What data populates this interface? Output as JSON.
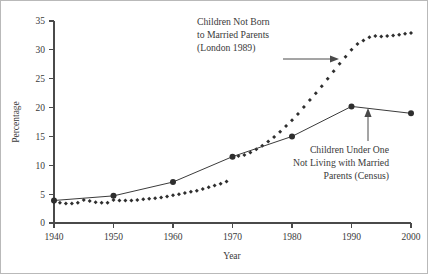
{
  "chart_data": {
    "type": "line",
    "title": "",
    "xlabel": "Year",
    "ylabel": "Percentage",
    "xlim": [
      1940,
      2000
    ],
    "ylim": [
      0,
      35
    ],
    "xticks": [
      1940,
      1950,
      1960,
      1970,
      1980,
      1990,
      2000
    ],
    "yticks": [
      0,
      5,
      10,
      15,
      20,
      25,
      30,
      35
    ],
    "grid": false,
    "legend": "annotations",
    "series": [
      {
        "name": "Children Not Born to Married Parents (London 1989)",
        "marker": "diamond",
        "style": "dotted-markers-only",
        "x": [
          1940,
          1941,
          1942,
          1943,
          1944,
          1945,
          1946,
          1947,
          1948,
          1949,
          1950,
          1951,
          1952,
          1953,
          1954,
          1955,
          1956,
          1957,
          1958,
          1959,
          1960,
          1961,
          1962,
          1963,
          1964,
          1965,
          1966,
          1967,
          1968,
          1969,
          1970,
          1971,
          1972,
          1973,
          1974,
          1975,
          1976,
          1977,
          1978,
          1979,
          1980,
          1981,
          1982,
          1983,
          1984,
          1985,
          1986,
          1987,
          1988,
          1989,
          1990,
          1991,
          1992,
          1993,
          1994,
          1995,
          1996,
          1997,
          1998,
          1999,
          2000
        ],
        "values": [
          3.6,
          3.5,
          3.4,
          3.4,
          3.5,
          4.0,
          3.8,
          3.6,
          3.5,
          3.5,
          4.0,
          3.9,
          3.9,
          3.9,
          4.0,
          4.1,
          4.2,
          4.3,
          4.4,
          4.6,
          4.8,
          5.0,
          5.2,
          5.4,
          5.6,
          5.9,
          6.2,
          6.5,
          6.8,
          7.2,
          11.4,
          11.6,
          11.8,
          12.2,
          12.8,
          13.4,
          14.1,
          14.9,
          15.8,
          16.8,
          17.8,
          18.9,
          20.1,
          21.3,
          22.5,
          23.7,
          25.0,
          26.3,
          27.6,
          28.8,
          30.0,
          31.0,
          31.6,
          32.2,
          32.4,
          32.3,
          32.4,
          32.5,
          32.6,
          32.8,
          32.9
        ]
      },
      {
        "name": "Children Under One Not Living with Married Parents (Census)",
        "marker": "circle",
        "style": "line-with-markers",
        "x": [
          1940,
          1950,
          1960,
          1970,
          1980,
          1990,
          2000
        ],
        "values": [
          3.9,
          4.7,
          7.1,
          11.5,
          15.0,
          20.2,
          19.0
        ]
      }
    ]
  },
  "annotations": {
    "london": "Children Not Born\nto Married Parents\n(London 1989)",
    "census": "Children Under One\nNot Living with Married\nParents (Census)"
  },
  "axes": {
    "ylabel": "Percentage",
    "xlabel": "Year",
    "ytick_labels": [
      "0",
      "5",
      "10",
      "15",
      "20",
      "25",
      "30",
      "35"
    ],
    "xtick_labels": [
      "1940",
      "1950",
      "1960",
      "1970",
      "1980",
      "1990",
      "2000"
    ]
  },
  "colors": {
    "axis": "#4a4a4a",
    "marker": "#2e2e2e",
    "text": "#3a3a3a",
    "border": "#b9b9b9",
    "background": "#ffffff"
  }
}
